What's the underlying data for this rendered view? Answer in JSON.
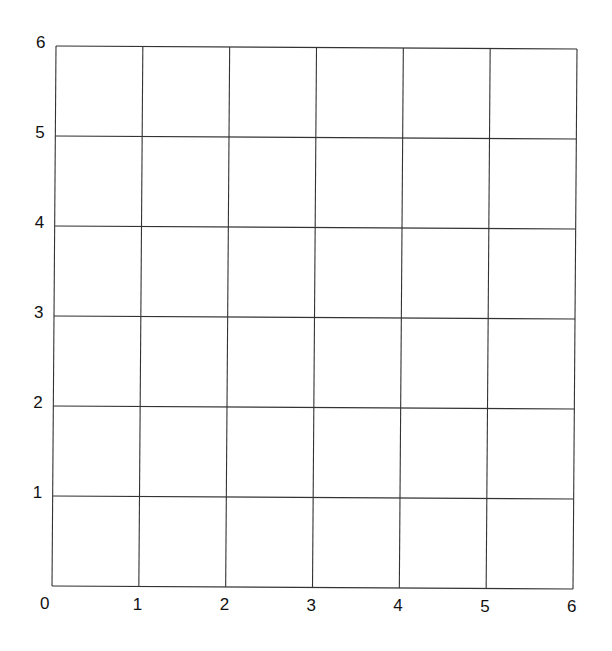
{
  "chart_data": {
    "type": "scatter",
    "title": "",
    "xlabel": "",
    "ylabel": "",
    "xlim": [
      0,
      6
    ],
    "ylim": [
      0,
      6
    ],
    "grid": true,
    "x_ticks": [
      "0",
      "1",
      "2",
      "3",
      "4",
      "5",
      "6"
    ],
    "y_ticks": [
      "1",
      "2",
      "3",
      "4",
      "5",
      "6"
    ],
    "series": []
  },
  "style": {
    "line_color": "#333333",
    "background": "#ffffff"
  }
}
